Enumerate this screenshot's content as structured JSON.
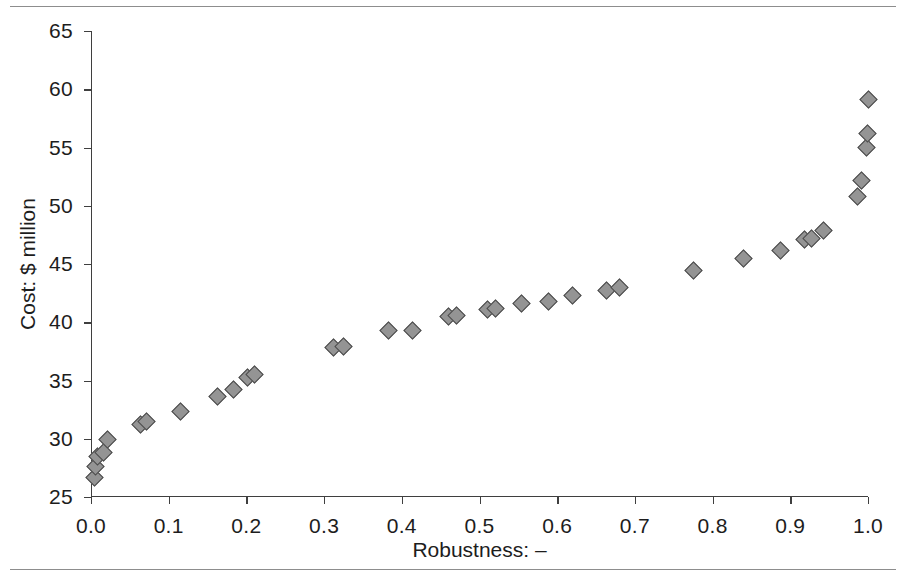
{
  "chart_data": {
    "type": "scatter",
    "title": "",
    "xlabel": "Robustness: –",
    "ylabel": "Cost: $ million",
    "xlim": [
      0.0,
      1.0
    ],
    "ylim": [
      25,
      65
    ],
    "xticks": [
      "0.0",
      "0.1",
      "0.2",
      "0.3",
      "0.4",
      "0.5",
      "0.6",
      "0.7",
      "0.8",
      "0.9",
      "1.0"
    ],
    "xtick_values": [
      0.0,
      0.1,
      0.2,
      0.3,
      0.4,
      0.5,
      0.6,
      0.7,
      0.8,
      0.9,
      1.0
    ],
    "yticks": [
      "25",
      "30",
      "35",
      "40",
      "45",
      "50",
      "55",
      "60",
      "65"
    ],
    "ytick_values": [
      25,
      30,
      35,
      40,
      45,
      50,
      55,
      60,
      65
    ],
    "grid": false,
    "legend": null,
    "marker": {
      "shape": "diamond",
      "fill_color": "#949494",
      "edge_color": "#4b4b4b",
      "size_px": 13
    },
    "points": [
      {
        "x": 0.004,
        "y": 26.7
      },
      {
        "x": 0.006,
        "y": 27.6
      },
      {
        "x": 0.008,
        "y": 28.5
      },
      {
        "x": 0.016,
        "y": 28.8
      },
      {
        "x": 0.021,
        "y": 29.9
      },
      {
        "x": 0.064,
        "y": 31.2
      },
      {
        "x": 0.072,
        "y": 31.5
      },
      {
        "x": 0.115,
        "y": 32.3
      },
      {
        "x": 0.163,
        "y": 33.6
      },
      {
        "x": 0.183,
        "y": 34.2
      },
      {
        "x": 0.201,
        "y": 35.3
      },
      {
        "x": 0.21,
        "y": 35.5
      },
      {
        "x": 0.312,
        "y": 37.8
      },
      {
        "x": 0.325,
        "y": 37.9
      },
      {
        "x": 0.383,
        "y": 39.3
      },
      {
        "x": 0.414,
        "y": 39.3
      },
      {
        "x": 0.46,
        "y": 40.5
      },
      {
        "x": 0.47,
        "y": 40.6
      },
      {
        "x": 0.51,
        "y": 41.1
      },
      {
        "x": 0.52,
        "y": 41.2
      },
      {
        "x": 0.554,
        "y": 41.6
      },
      {
        "x": 0.589,
        "y": 41.8
      },
      {
        "x": 0.62,
        "y": 42.3
      },
      {
        "x": 0.664,
        "y": 42.7
      },
      {
        "x": 0.68,
        "y": 43.0
      },
      {
        "x": 0.776,
        "y": 44.4
      },
      {
        "x": 0.84,
        "y": 45.5
      },
      {
        "x": 0.888,
        "y": 46.2
      },
      {
        "x": 0.918,
        "y": 47.1
      },
      {
        "x": 0.927,
        "y": 47.2
      },
      {
        "x": 0.943,
        "y": 47.9
      },
      {
        "x": 0.986,
        "y": 50.8
      },
      {
        "x": 0.992,
        "y": 52.2
      },
      {
        "x": 0.998,
        "y": 55.0
      },
      {
        "x": 0.999,
        "y": 56.2
      },
      {
        "x": 1.0,
        "y": 59.1
      }
    ]
  }
}
